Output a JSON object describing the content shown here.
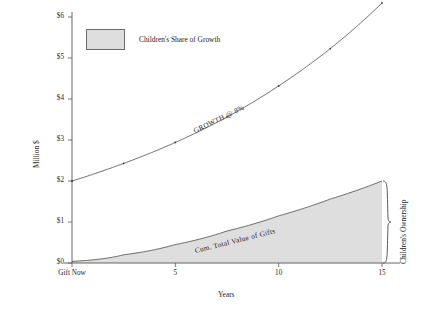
{
  "chart_data": {
    "type": "line",
    "title": "",
    "xlabel": "Years",
    "ylabel": "Million $",
    "xlim": [
      0,
      16
    ],
    "ylim": [
      0,
      6.5
    ],
    "grid": false,
    "legend_position": "top-left",
    "x_tick_labels": [
      "Gift Now",
      "5",
      "10",
      "15"
    ],
    "x_tick_values": [
      0,
      5,
      10,
      15
    ],
    "y_tick_labels": [
      "$0",
      "$1",
      "$2",
      "$3",
      "$4",
      "$5",
      "$6"
    ],
    "y_tick_values": [
      0,
      1,
      2,
      3,
      4,
      5,
      6
    ],
    "series": [
      {
        "name": "GROWTH @ 8%",
        "markers": true,
        "x": [
          0,
          2.5,
          5,
          7.5,
          10,
          12.5,
          15
        ],
        "values": [
          2.0,
          2.43,
          2.94,
          3.56,
          4.32,
          5.23,
          6.34
        ]
      },
      {
        "name": "Cum. Total Value of Gifts",
        "markers": false,
        "filled": true,
        "x": [
          0,
          2.5,
          5,
          7.5,
          10,
          12.5,
          15
        ],
        "values": [
          0.04,
          0.2,
          0.45,
          0.78,
          1.15,
          1.56,
          2.0
        ]
      }
    ],
    "annotations": [
      {
        "text": "GROWTH @ 8%",
        "kind": "curve-label"
      },
      {
        "text": "Cum. Total Value of Gifts",
        "kind": "curve-label"
      },
      {
        "text": "Children's Ownership",
        "kind": "brace-label"
      }
    ],
    "legend": [
      {
        "label": "Children's Share of Growth",
        "swatch_color": "#dedede"
      }
    ],
    "colors": {
      "area_fill": "#dedede",
      "line": "#4a4a4a",
      "axis": "#555555",
      "text": "#1d1d1d"
    }
  },
  "axes": {
    "y_title": "Million $",
    "x_title": "Years"
  },
  "legend": {
    "entry_label": "Children's Share of Growth"
  },
  "labels": {
    "growth_curve": "GROWTH @ 8%",
    "gift_curve": "Cum. Total Value of Gifts",
    "children_ownership": "Children's Ownership"
  },
  "y_ticks": [
    "$6",
    "$5",
    "$4",
    "$3",
    "$2",
    "$1",
    "$0"
  ],
  "x_ticks": [
    "Gift Now",
    "5",
    "10",
    "15"
  ]
}
